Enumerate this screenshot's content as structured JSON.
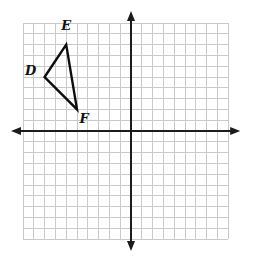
{
  "figure": {
    "background_color": "#ffffff",
    "grid": {
      "x_min": -10,
      "x_max": 9,
      "y_min": -10,
      "y_max": 10,
      "cell_px": 10.8,
      "origin_px": {
        "x": 131,
        "y": 131
      },
      "grid_color": "#c9c9c9",
      "axis_color": "#1b1b1b",
      "axis_stroke_width": 2,
      "axis_overhang_px": 12,
      "arrow_length_px": 10,
      "arrow_half_width_px": 4
    },
    "triangle": {
      "name": "DEF",
      "stroke_color": "#0d0d0d",
      "stroke_width": 2.4,
      "vertices": [
        {
          "label": "D",
          "x": -8,
          "y": 5,
          "label_dx": -14,
          "label_dy": -7
        },
        {
          "label": "E",
          "x": -6,
          "y": 8,
          "label_dx": 0,
          "label_dy": -19
        },
        {
          "label": "F",
          "x": -5,
          "y": 2,
          "label_dx": 7,
          "label_dy": 9
        }
      ],
      "label_color": "#111111"
    }
  }
}
